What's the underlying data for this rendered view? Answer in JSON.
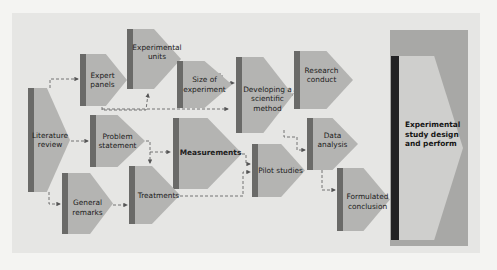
{
  "diagram": {
    "nodes": [
      {
        "id": "literature_review",
        "label_lines": [
          "Literature",
          "review"
        ]
      },
      {
        "id": "expert_panels",
        "label_lines": [
          "Expert",
          "panels"
        ]
      },
      {
        "id": "experimental_units",
        "label_lines": [
          "Experimental",
          "units"
        ]
      },
      {
        "id": "size_of_experiment",
        "label_lines": [
          "Size of",
          "experiment"
        ]
      },
      {
        "id": "developing_method",
        "label_lines": [
          "Developing a",
          "scientific",
          "method"
        ]
      },
      {
        "id": "research_conduct",
        "label_lines": [
          "Research",
          "conduct"
        ]
      },
      {
        "id": "problem_statement",
        "label_lines": [
          "Problem",
          "statement"
        ]
      },
      {
        "id": "measurements",
        "label_lines": [
          "Measurements"
        ]
      },
      {
        "id": "general_remarks",
        "label_lines": [
          "General",
          "remarks"
        ]
      },
      {
        "id": "treatments",
        "label_lines": [
          "Treatments"
        ]
      },
      {
        "id": "pilot_studies",
        "label_lines": [
          "Pilot studies"
        ]
      },
      {
        "id": "data_analysis",
        "label_lines": [
          "Data",
          "analysis"
        ]
      },
      {
        "id": "formulated_conclusion",
        "label_lines": [
          "Formulated",
          "conclusion"
        ]
      }
    ],
    "labels": {
      "literature_review": "Literature\nreview",
      "expert_panels": "Expert\npanels",
      "experimental_units": "Experimental\nunits",
      "size_of_experiment": "Size of\nexperiment",
      "developing_method": "Developing a\nscientific\nmethod",
      "research_conduct": "Research\nconduct",
      "problem_statement": "Problem\nstatement",
      "measurements": "Measurements",
      "general_remarks": "General\nremarks",
      "treatments": "Treatments",
      "pilot_studies": "Pilot studies",
      "data_analysis": "Data\nanalysis",
      "formulated_conclusion": "Formulated\nconclusion"
    },
    "summary_panel": {
      "label": "Experimental\nstudy design\nand perform"
    },
    "edges": [
      [
        "literature_review",
        "expert_panels"
      ],
      [
        "literature_review",
        "problem_statement"
      ],
      [
        "literature_review",
        "general_remarks"
      ],
      [
        "expert_panels",
        "experimental_units"
      ],
      [
        "expert_panels",
        "size_of_experiment"
      ],
      [
        "size_of_experiment",
        "developing_method"
      ],
      [
        "developing_method",
        "research_conduct"
      ],
      [
        "developing_method",
        "data_analysis"
      ],
      [
        "problem_statement",
        "measurements"
      ],
      [
        "problem_statement",
        "treatments"
      ],
      [
        "general_remarks",
        "treatments"
      ],
      [
        "measurements",
        "pilot_studies"
      ],
      [
        "treatments",
        "pilot_studies"
      ],
      [
        "data_analysis",
        "formulated_conclusion"
      ]
    ],
    "colors": {
      "node_fill": "#b4b4b2",
      "node_bar": "#6a6a68",
      "panel_outer": "#a8a8a6",
      "panel_inner": "#cfcfcd",
      "panel_bar": "#222224",
      "background": "#e6e6e4"
    }
  }
}
